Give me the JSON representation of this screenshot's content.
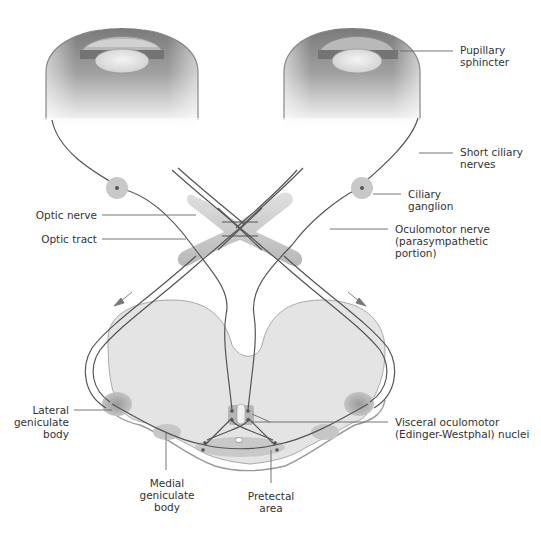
{
  "labels": {
    "pupillary_sphincter": "Pupillary\nsphincter",
    "short_ciliary_nerves": "Short ciliary\nnerves",
    "ciliary_ganglion": "Ciliary\nganglion",
    "optic_nerve": "Optic nerve",
    "optic_tract": "Optic tract",
    "oculomotor_nerve": "Oculomotor nerve\n(parasympathetic\nportion)",
    "lateral_geniculate_body": "Lateral\ngeniculate\nbody",
    "visceral_oculomotor_nuclei": "Visceral oculomotor\n(Edinger-Westphal) nuclei",
    "medial_geniculate_body": "Medial\ngeniculate\nbody",
    "pretectal_area": "Pretectal\narea"
  },
  "colors": {
    "nerve": "#555555",
    "tissue": "#e6e6e6",
    "ganglion": "#c8c8c8",
    "leader": "#666666",
    "text": "#333333"
  }
}
